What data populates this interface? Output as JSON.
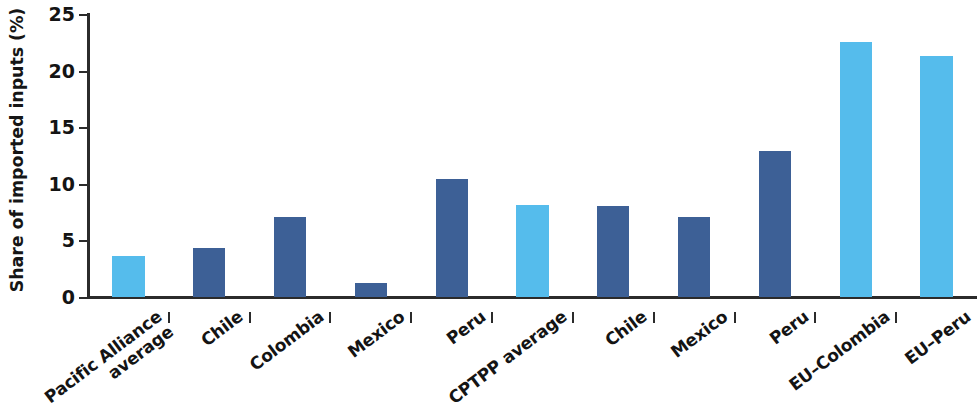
{
  "chart_data": {
    "type": "bar",
    "title": "",
    "xlabel": "",
    "ylabel": "Share of imported inputs (%)",
    "ylim": [
      0,
      25
    ],
    "ytick_labels": [
      "0",
      "5",
      "10",
      "15",
      "20",
      "25"
    ],
    "ytick_values": [
      0,
      5,
      10,
      15,
      20,
      25
    ],
    "grid": false,
    "legend": "none",
    "categories": [
      "Pacific Alliance average",
      "Chile",
      "Colombia",
      "Mexico",
      "Peru",
      "CPTPP average",
      "Chile",
      "Mexico",
      "Peru",
      "EU–Colombia",
      "EU–Peru"
    ],
    "values": [
      3.6,
      4.3,
      7.1,
      1.2,
      10.4,
      8.1,
      8.0,
      7.1,
      12.9,
      22.5,
      21.3
    ],
    "bar_colors": [
      "#55bcec",
      "#3d6096",
      "#3d6096",
      "#3d6096",
      "#3d6096",
      "#55bcec",
      "#3d6096",
      "#3d6096",
      "#3d6096",
      "#55bcec",
      "#55bcec"
    ],
    "color_light": "#55bcec",
    "color_dark": "#3d6096",
    "axis_color": "#2b2b2b"
  },
  "x_labels": [
    {
      "line1": "Pacific Alliance",
      "line2": "average"
    },
    {
      "line1": "Chile",
      "line2": ""
    },
    {
      "line1": "Colombia",
      "line2": ""
    },
    {
      "line1": "Mexico",
      "line2": ""
    },
    {
      "line1": "Peru",
      "line2": ""
    },
    {
      "line1": "CPTPP average",
      "line2": ""
    },
    {
      "line1": "Chile",
      "line2": ""
    },
    {
      "line1": "Mexico",
      "line2": ""
    },
    {
      "line1": "Peru",
      "line2": ""
    },
    {
      "line1": "EU–Colombia",
      "line2": ""
    },
    {
      "line1": "EU–Peru",
      "line2": ""
    }
  ]
}
